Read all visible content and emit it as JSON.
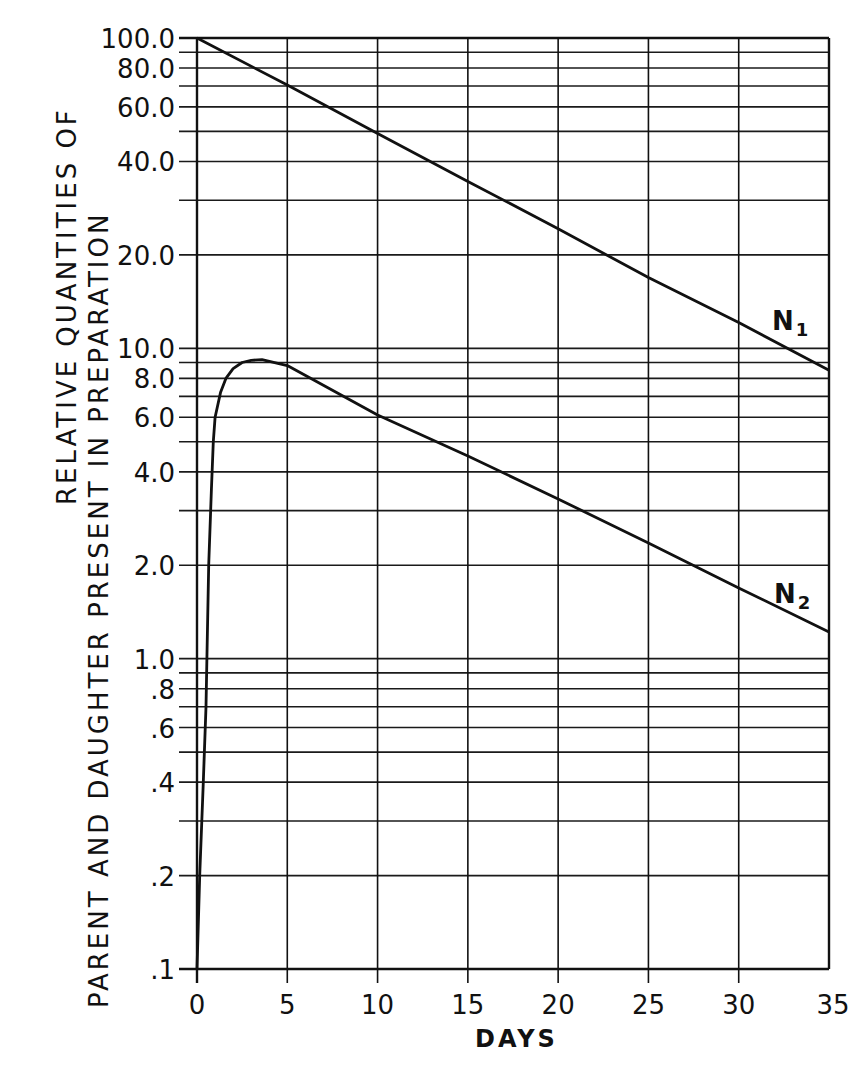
{
  "chart_data": {
    "type": "line",
    "title": "",
    "xlabel": "DAYS",
    "ylabel_line1": "RELATIVE QUANTITIES OF",
    "ylabel_line2": "PARENT AND DAUGHTER PRESENT IN PREPARATION",
    "yscale": "log",
    "xlim": [
      0,
      35
    ],
    "ylim": [
      0.1,
      100.0
    ],
    "grid": true,
    "x_ticks": [
      0,
      5,
      10,
      15,
      20,
      25,
      30,
      35
    ],
    "x_tick_labels": [
      "0",
      "5",
      "10",
      "15",
      "20",
      "25",
      "30",
      "35"
    ],
    "y_ticks": [
      100.0,
      80.0,
      60.0,
      40.0,
      20.0,
      10.0,
      8.0,
      6.0,
      4.0,
      2.0,
      1.0,
      0.8,
      0.6,
      0.4,
      0.2,
      0.1
    ],
    "y_tick_labels": [
      "100.0",
      "80.0",
      "60.0",
      "40.0",
      "20.0",
      "10.0",
      "8.0",
      "6.0",
      "4.0",
      "2.0",
      "1.0",
      ".8",
      ".6",
      ".4",
      ".2",
      ".1"
    ],
    "series": [
      {
        "name": "N1",
        "label_main": "N",
        "label_sub": "1",
        "x": [
          0,
          5,
          10,
          15,
          20,
          25,
          30,
          35
        ],
        "values": [
          100.0,
          70.5,
          49.2,
          34.5,
          24.3,
          16.9,
          12.1,
          8.5
        ]
      },
      {
        "name": "N2",
        "label_main": "N",
        "label_sub": "2",
        "x": [
          0,
          0.15,
          0.35,
          0.5,
          0.55,
          0.65,
          0.8,
          0.9,
          1.0,
          1.3,
          1.6,
          2.0,
          2.5,
          3.0,
          3.6,
          5,
          10,
          15,
          20,
          25,
          30,
          35
        ],
        "values": [
          0.1,
          0.2,
          0.4,
          0.7,
          1.0,
          2.0,
          3.5,
          5.0,
          6.0,
          7.2,
          8.0,
          8.6,
          9.0,
          9.15,
          9.2,
          8.8,
          6.1,
          4.5,
          3.27,
          2.36,
          1.69,
          1.22
        ]
      }
    ]
  }
}
